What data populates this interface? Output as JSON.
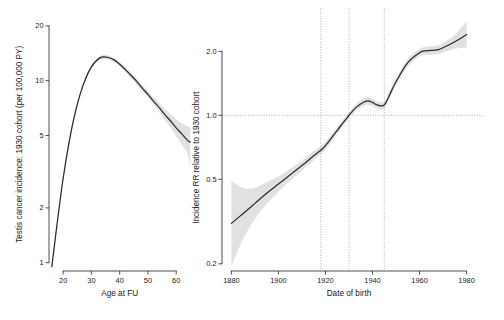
{
  "figure": {
    "background": "#ffffff",
    "line_color": "#2b2b2b",
    "band_color": "#c9c9c9",
    "reference_color": "#9a9a9a"
  },
  "chart_data": [
    {
      "type": "line",
      "panel": "left",
      "title": "",
      "xlabel": "Age at FU",
      "ylabel": "Testis cancer incidence: 1930 cohort (per 100,000 PY)",
      "yscale": "log",
      "xlim": [
        15,
        67
      ],
      "ylim": [
        0.9,
        21
      ],
      "xticks": [
        20,
        30,
        40,
        50,
        60
      ],
      "xticklabels": [
        "20",
        "30",
        "40",
        "50",
        "60"
      ],
      "yticks": [
        1,
        2,
        5,
        10,
        20
      ],
      "yticklabels": [
        "1",
        "2",
        "5",
        "10",
        "20"
      ],
      "grid": false,
      "legend": "none",
      "series": [
        {
          "name": "Fitted incidence",
          "x": [
            16,
            18,
            20,
            22,
            24,
            26,
            28,
            30,
            32,
            34,
            36,
            38,
            40,
            42,
            44,
            46,
            48,
            50,
            52,
            54,
            56,
            58,
            60,
            62,
            64,
            65
          ],
          "values": [
            0.95,
            1.7,
            2.9,
            4.5,
            6.4,
            8.4,
            10.3,
            11.9,
            13.0,
            13.5,
            13.4,
            13.0,
            12.3,
            11.5,
            10.7,
            9.9,
            9.1,
            8.4,
            7.7,
            7.1,
            6.5,
            6.0,
            5.5,
            5.1,
            4.7,
            4.6
          ],
          "ci_low": [
            0.92,
            1.66,
            2.84,
            4.4,
            6.28,
            8.25,
            10.1,
            11.65,
            12.7,
            13.15,
            13.05,
            12.65,
            11.95,
            11.15,
            10.35,
            9.55,
            8.75,
            8.05,
            7.35,
            6.7,
            6.05,
            5.5,
            4.95,
            4.45,
            3.95,
            3.35
          ],
          "ci_high": [
            0.99,
            1.75,
            2.97,
            4.61,
            6.55,
            8.58,
            10.52,
            12.18,
            13.32,
            13.85,
            13.76,
            13.36,
            12.67,
            11.87,
            11.07,
            10.27,
            9.47,
            8.77,
            8.07,
            7.53,
            6.98,
            6.55,
            6.12,
            5.82,
            5.62,
            5.6
          ]
        }
      ]
    },
    {
      "type": "line",
      "panel": "right",
      "title": "",
      "xlabel": "Date of birth",
      "ylabel": "Incidence RR relative to 1930 cohort",
      "yscale": "log",
      "xlim": [
        1876,
        1984
      ],
      "ylim": [
        0.185,
        2.75
      ],
      "xticks": [
        1880,
        1900,
        1920,
        1940,
        1960,
        1980
      ],
      "xticklabels": [
        "1880",
        "1900",
        "1920",
        "1940",
        "1960",
        "1980"
      ],
      "yticks": [
        0.2,
        0.5,
        1.0,
        2.0
      ],
      "yticklabels": [
        "0.2",
        "0.5",
        "1.0",
        "2.0"
      ],
      "grid": false,
      "legend": "none",
      "reference_lines": {
        "horizontal": [
          1.0
        ],
        "vertical": [
          1918,
          1930,
          1945
        ]
      },
      "series": [
        {
          "name": "Incidence rate ratio",
          "x": [
            1880,
            1885,
            1890,
            1895,
            1900,
            1905,
            1910,
            1915,
            1918,
            1920,
            1925,
            1930,
            1933,
            1936,
            1938,
            1940,
            1942,
            1945,
            1948,
            1950,
            1955,
            1960,
            1962,
            1965,
            1968,
            1970,
            1975,
            1980
          ],
          "values": [
            0.31,
            0.345,
            0.385,
            0.43,
            0.475,
            0.525,
            0.58,
            0.645,
            0.685,
            0.72,
            0.85,
            1.0,
            1.09,
            1.15,
            1.17,
            1.15,
            1.12,
            1.12,
            1.3,
            1.44,
            1.77,
            1.97,
            2.01,
            2.02,
            2.04,
            2.08,
            2.22,
            2.4
          ],
          "ci_low": [
            0.196,
            0.262,
            0.325,
            0.382,
            0.437,
            0.492,
            0.549,
            0.614,
            0.655,
            0.69,
            0.82,
            0.97,
            1.05,
            1.105,
            1.122,
            1.105,
            1.08,
            1.08,
            1.25,
            1.385,
            1.7,
            1.89,
            1.925,
            1.93,
            1.945,
            1.975,
            2.06,
            2.08
          ],
          "ci_high": [
            0.492,
            0.455,
            0.456,
            0.484,
            0.516,
            0.56,
            0.613,
            0.678,
            0.717,
            0.752,
            0.881,
            1.031,
            1.131,
            1.197,
            1.22,
            1.197,
            1.162,
            1.162,
            1.352,
            1.497,
            1.843,
            2.054,
            2.098,
            2.115,
            2.14,
            2.19,
            2.392,
            2.77
          ]
        }
      ]
    }
  ]
}
